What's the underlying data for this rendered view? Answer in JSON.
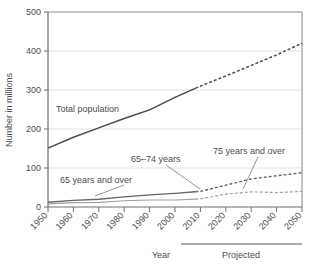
{
  "chart_data": {
    "type": "line",
    "title": "",
    "xlabel": "Year",
    "ylabel": "Number in millions",
    "ylim": [
      0,
      500
    ],
    "xlim": [
      1950,
      2050
    ],
    "yticks": [
      "0",
      "100",
      "200",
      "300",
      "400",
      "500"
    ],
    "ytick_values": [
      0,
      100,
      200,
      300,
      400,
      500
    ],
    "xticks": [
      "1950",
      "1960",
      "1970",
      "1980",
      "1990",
      "2000",
      "2010",
      "2020",
      "2030",
      "2040",
      "2050"
    ],
    "xtick_values": [
      1950,
      1960,
      1970,
      1980,
      1990,
      2000,
      2010,
      2020,
      2030,
      2040,
      2050
    ],
    "grid": true,
    "grid_axis": "y",
    "legend": "inline-annotations",
    "projection_start": 2008,
    "x": [
      1950,
      1960,
      1970,
      1980,
      1990,
      2000,
      2010,
      2020,
      2030,
      2040,
      2050
    ],
    "series": [
      {
        "name": "Total population",
        "values": [
          151,
          179,
          203,
          227,
          249,
          281,
          310,
          336,
          363,
          390,
          420
        ],
        "style": "solid-then-dashed",
        "color": "#4a4a4a"
      },
      {
        "name": "65 years and over",
        "values": [
          12,
          17,
          20,
          26,
          31,
          35,
          40,
          56,
          72,
          80,
          88
        ],
        "style": "solid-then-dashed",
        "color": "#666666"
      },
      {
        "name": "65-74 years",
        "values": [
          8,
          11,
          12,
          16,
          18,
          18,
          21,
          33,
          39,
          37,
          40
        ],
        "style": "solid-then-dashed",
        "color": "#a0a0a0"
      }
    ],
    "annotations": [
      {
        "text": "Total population",
        "x": 78,
        "y": 108
      },
      {
        "text": "65 years and over",
        "x": 62,
        "y": 181
      },
      {
        "text": "65–74 years",
        "x": 133,
        "y": 160
      },
      {
        "text": "75 years and over",
        "x": 214,
        "y": 152
      },
      {
        "text": "Projected",
        "x": 212,
        "y": 255
      },
      {
        "text": "Year",
        "x": 161,
        "y": 255
      }
    ],
    "colors": {
      "grid": "#e3e3e3",
      "frame": "#9a9a9a",
      "axis": "#6e6e6e",
      "text": "#4d4d4d",
      "total": "#4a4a4a",
      "sixty_five_plus": "#666666",
      "seventy_five_plus": "#a0a0a0"
    }
  },
  "axis": {
    "y_title": "Number in millions",
    "x_title": "Year",
    "projected_label": "Projected"
  },
  "labels": {
    "total_population": "Total population",
    "sixty_five_and_over": "65 years and over",
    "sixty_five_to_seventy_four": "65–74 years",
    "seventy_five_and_over": "75 years and over"
  },
  "yticks": {
    "t0": "0",
    "t1": "100",
    "t2": "200",
    "t3": "300",
    "t4": "400",
    "t5": "500"
  },
  "xticks": {
    "t0": "1950",
    "t1": "1960",
    "t2": "1970",
    "t3": "1980",
    "t4": "1990",
    "t5": "2000",
    "t6": "2010",
    "t7": "2020",
    "t8": "2030",
    "t9": "2040",
    "t10": "2050"
  }
}
